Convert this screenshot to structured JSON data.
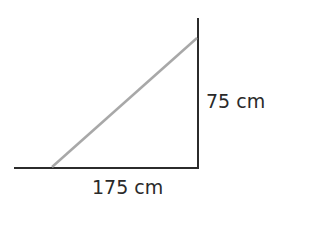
{
  "diagram": {
    "type": "right-triangle",
    "labels": {
      "horizontal": "175 cm",
      "vertical": "75 cm"
    },
    "colors": {
      "legs": "#2b2b2b",
      "hypotenuse": "#a8a8a8",
      "text": "#2a2a2a"
    }
  }
}
